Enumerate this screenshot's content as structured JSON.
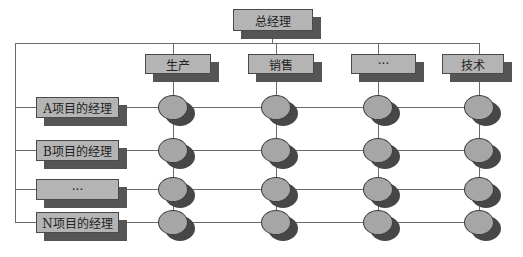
{
  "diagram": {
    "type": "matrix-organization-chart",
    "root": {
      "label": "总经理"
    },
    "departments": [
      {
        "label": "生产"
      },
      {
        "label": "销售"
      },
      {
        "label": "···"
      },
      {
        "label": "技术"
      }
    ],
    "project_managers": [
      {
        "label": "A项目的经理"
      },
      {
        "label": "B项目的经理"
      },
      {
        "label": "···"
      },
      {
        "label": "N项目的经理"
      }
    ],
    "intersection_nodes": {
      "rows": 4,
      "columns": 4
    },
    "colors": {
      "box_fill": "#b4b4b4",
      "box_shadow": "#555555",
      "node_fill": "#a6a6a6",
      "node_shadow": "#474747",
      "line": "#6a6a6a"
    },
    "caption": ""
  }
}
